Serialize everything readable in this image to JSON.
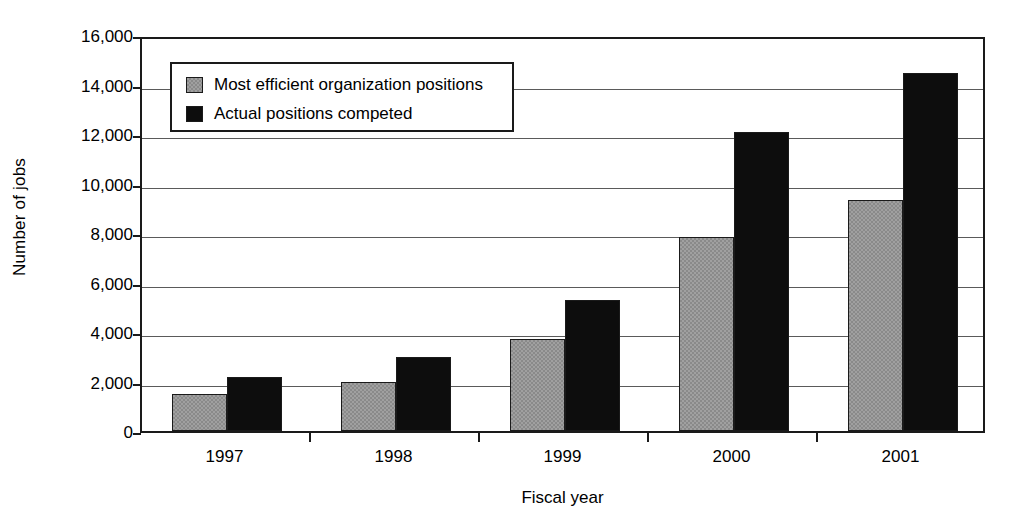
{
  "chart_data": {
    "type": "bar",
    "title": "",
    "xlabel": "Fiscal year",
    "ylabel": "Number of jobs",
    "categories": [
      "1997",
      "1998",
      "1999",
      "2000",
      "2001"
    ],
    "series": [
      {
        "name": "Most efficient organization positions",
        "color": "#a0a0a0",
        "values": [
          1480,
          2000,
          3730,
          7850,
          9350
        ]
      },
      {
        "name": "Actual positions competed",
        "color": "#0d0d0d",
        "values": [
          2180,
          2980,
          5300,
          12100,
          14450
        ]
      }
    ],
    "ylim": [
      0,
      16000
    ],
    "ytick_values": [
      0,
      2000,
      4000,
      6000,
      8000,
      10000,
      12000,
      14000,
      16000
    ],
    "ytick_labels": [
      "0",
      "2,000",
      "4,000",
      "6,000",
      "8,000",
      "10,000",
      "12,000",
      "14,000",
      "16,000"
    ],
    "grid": true,
    "legend_position": "upper left"
  }
}
